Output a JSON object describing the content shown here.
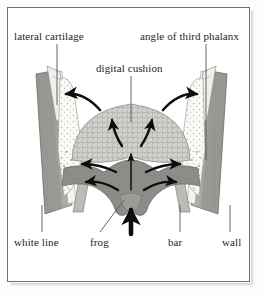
{
  "figure": {
    "domain_subject": "equine hoof cross-section",
    "frame_color": "#6e6e6e",
    "background_color": "#ffffff",
    "label_color": "#262626",
    "arrow_color": "#0d0d0d",
    "leader_line_color": "#555555"
  },
  "labels": {
    "lateral_cartilage": "lateral cartilage",
    "angle_of_third_phalanx": "angle of third phalanx",
    "digital_cushion": "digital cushion",
    "white_line": "white line",
    "frog": "frog",
    "bar": "bar",
    "wall": "wall"
  },
  "structures": [
    {
      "name": "digital-cushion",
      "label": "digital cushion",
      "fill": "#cfcfcb",
      "description": "dome shaped stippled mass at center"
    },
    {
      "name": "frog",
      "label": "frog",
      "fill": "#8f8f8c",
      "description": "darker gray band below cushion with central bulge"
    },
    {
      "name": "bar-left",
      "label": "bar",
      "fill": "#b9b9b4",
      "description": "angled light strip left of frog"
    },
    {
      "name": "bar-right",
      "label": "bar",
      "fill": "#b9b9b4",
      "description": "angled light strip right of frog"
    },
    {
      "name": "wall-left",
      "label": "wall",
      "fill": "#9a9a95",
      "description": "tapering vertical band at left edge"
    },
    {
      "name": "wall-right",
      "label": "wall",
      "fill": "#9a9a95",
      "description": "tapering vertical band at right edge"
    },
    {
      "name": "white-line-left",
      "label": "white line",
      "fill": "#f2f2ee",
      "description": "pale strip inside left wall"
    },
    {
      "name": "white-line-right",
      "label": "white line",
      "fill": "#f2f2ee",
      "description": "pale strip inside right wall"
    },
    {
      "name": "lateral-cartilage-left",
      "label": "lateral cartilage",
      "fill": "#fafaf7",
      "description": "stippled pale wedge upper left"
    },
    {
      "name": "lateral-cartilage-right",
      "label": "lateral cartilage",
      "fill": "#fafaf7",
      "description": "stippled pale wedge upper right"
    },
    {
      "name": "angle-of-third-phalanx-left",
      "label": "angle of third phalanx",
      "fill": "#ededea",
      "description": "narrow pointed process upper left"
    },
    {
      "name": "angle-of-third-phalanx-right",
      "label": "angle of third phalanx",
      "fill": "#ededea",
      "description": "narrow pointed process upper right"
    }
  ],
  "arrows": [
    {
      "name": "cushion-expand-upper-left",
      "style": "curved",
      "direction": "up-left"
    },
    {
      "name": "cushion-expand-upper-right",
      "style": "curved",
      "direction": "up-right"
    },
    {
      "name": "cushion-inner-left",
      "style": "curved",
      "direction": "up-left"
    },
    {
      "name": "cushion-inner-right",
      "style": "curved",
      "direction": "up-right"
    },
    {
      "name": "central-load-upper",
      "style": "straight-thin",
      "direction": "up"
    },
    {
      "name": "ground-reaction-lower",
      "style": "straight-thick",
      "direction": "up"
    },
    {
      "name": "frog-spread-left-upper",
      "style": "curved",
      "direction": "left"
    },
    {
      "name": "frog-spread-left-lower",
      "style": "curved",
      "direction": "left"
    },
    {
      "name": "frog-spread-right-upper",
      "style": "curved",
      "direction": "right"
    },
    {
      "name": "frog-spread-right-lower",
      "style": "curved",
      "direction": "right"
    }
  ],
  "leader_lines": [
    {
      "name": "leader-lateral-cartilage",
      "from": "lateral cartilage",
      "orientation": "vertical"
    },
    {
      "name": "leader-angle-phalanx",
      "from": "angle of third phalanx",
      "orientation": "vertical"
    },
    {
      "name": "leader-digital-cushion",
      "from": "digital cushion",
      "orientation": "vertical"
    },
    {
      "name": "leader-white-line",
      "from": "white line",
      "orientation": "vertical"
    },
    {
      "name": "leader-frog",
      "from": "frog",
      "orientation": "diagonal"
    },
    {
      "name": "leader-bar",
      "from": "bar",
      "orientation": "vertical"
    },
    {
      "name": "leader-wall",
      "from": "wall",
      "orientation": "vertical"
    }
  ]
}
